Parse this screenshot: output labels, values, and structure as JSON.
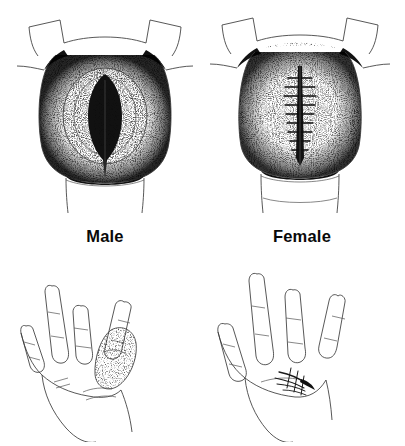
{
  "figure": {
    "background_color": "#ffffff",
    "ink_color": "#1a1a1a",
    "columns": 2,
    "rows": 2,
    "style": "stippled pen-and-ink line drawing"
  },
  "captions": {
    "male": "Male",
    "female": "Female"
  },
  "panels": {
    "top_left": {
      "label": "Male",
      "caption_key": "male",
      "subject": "male anatomy, frontal view",
      "features": "open stippled oval aperture with dark central slit, flared lateral folds, shaded torso block above, limb below"
    },
    "top_right": {
      "label": "Female",
      "caption_key": "female",
      "subject": "female anatomy, frontal view",
      "features": "closed stippled field with dark vertical midline seam showing transverse suture marks, flared lateral folds, shaded torso block above, limb below"
    },
    "bottom_left": {
      "label": "Male",
      "caption_key": "male",
      "subject": "left hand analogy, open thumb",
      "features": "four extended fingers and a separate stippled shaded thumb held apart from the palm, wrist and forearm tapering downward"
    },
    "bottom_right": {
      "label": "Female",
      "caption_key": "female",
      "subject": "left hand analogy, closed thumb",
      "features": "four extended fingers with the thumb region closed and marked by a short sutured scar at the base of the palm, wrist and forearm tapering downward"
    }
  },
  "colors": {
    "background": "#ffffff",
    "ink": "#1a1a1a",
    "stipple_light": "#888888",
    "stipple_dark": "#111111",
    "caption": "#0a0a0a"
  }
}
